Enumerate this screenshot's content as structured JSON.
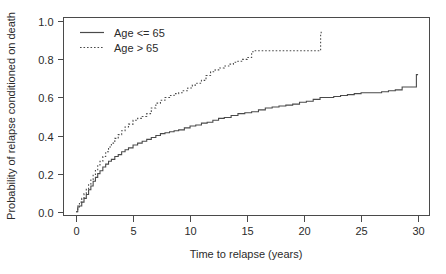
{
  "chart_data": {
    "type": "line",
    "title": "",
    "xlabel": "Time to relapse (years)",
    "ylabel": "Probability of relapse conditioned on death",
    "xlim": [
      -1.1,
      31.0
    ],
    "ylim": [
      -0.02,
      1.02
    ],
    "xticks": [
      0,
      5,
      10,
      15,
      20,
      25,
      30
    ],
    "xticklabels": [
      "0",
      "5",
      "10",
      "15",
      "20",
      "25",
      "30"
    ],
    "yticks": [
      0.0,
      0.2,
      0.4,
      0.6,
      0.8,
      1.0
    ],
    "yticklabels": [
      "0.0",
      "0.2",
      "0.4",
      "0.6",
      "0.8",
      "1.0"
    ],
    "grid": false,
    "frame": true,
    "legend_position": "top-left",
    "line_color": "#4a4a4a",
    "series": [
      {
        "name": "Age <= 65",
        "style": "solid",
        "step": true,
        "x": [
          0.0,
          0.15,
          0.3,
          0.5,
          0.7,
          0.9,
          1.1,
          1.3,
          1.5,
          1.7,
          1.9,
          2.1,
          2.35,
          2.6,
          2.85,
          3.1,
          3.4,
          3.7,
          4.0,
          4.3,
          4.6,
          5.0,
          5.4,
          5.8,
          6.2,
          6.6,
          7.0,
          7.4,
          7.8,
          8.2,
          8.6,
          9.0,
          9.5,
          10.0,
          10.5,
          11.0,
          11.5,
          12.0,
          12.5,
          13.0,
          13.6,
          14.2,
          14.8,
          15.4,
          16.0,
          16.6,
          17.2,
          17.8,
          18.4,
          19.0,
          19.6,
          20.2,
          20.8,
          21.4,
          22.0,
          22.6,
          23.2,
          23.8,
          24.4,
          25.0,
          25.6,
          26.2,
          26.8,
          27.4,
          28.0,
          28.6,
          29.2,
          29.6,
          29.85,
          30.0
        ],
        "y": [
          0.0,
          0.025,
          0.03,
          0.05,
          0.07,
          0.09,
          0.115,
          0.135,
          0.16,
          0.18,
          0.2,
          0.215,
          0.235,
          0.25,
          0.265,
          0.275,
          0.29,
          0.3,
          0.315,
          0.325,
          0.335,
          0.35,
          0.36,
          0.37,
          0.38,
          0.39,
          0.4,
          0.41,
          0.415,
          0.42,
          0.425,
          0.43,
          0.44,
          0.45,
          0.455,
          0.465,
          0.47,
          0.48,
          0.49,
          0.495,
          0.505,
          0.515,
          0.52,
          0.525,
          0.535,
          0.545,
          0.55,
          0.555,
          0.56,
          0.565,
          0.575,
          0.58,
          0.59,
          0.6,
          0.6,
          0.605,
          0.61,
          0.615,
          0.62,
          0.625,
          0.625,
          0.625,
          0.63,
          0.635,
          0.64,
          0.655,
          0.655,
          0.655,
          0.72,
          0.72
        ]
      },
      {
        "name": "Age > 65",
        "style": "dotted",
        "step": true,
        "x": [
          0.0,
          0.15,
          0.3,
          0.5,
          0.7,
          0.9,
          1.1,
          1.3,
          1.5,
          1.7,
          1.9,
          2.1,
          2.35,
          2.6,
          2.85,
          3.1,
          3.4,
          3.7,
          4.0,
          4.3,
          4.6,
          5.0,
          5.4,
          5.8,
          6.2,
          6.6,
          7.0,
          7.4,
          7.8,
          8.2,
          8.6,
          9.0,
          9.4,
          9.8,
          10.2,
          10.6,
          11.0,
          11.4,
          11.8,
          12.2,
          12.6,
          13.0,
          13.4,
          13.8,
          14.2,
          14.6,
          15.0,
          15.4,
          15.6,
          16.0,
          17.0,
          18.0,
          19.0,
          20.0,
          21.0,
          21.4,
          21.45,
          21.5
        ],
        "y": [
          0.0,
          0.03,
          0.05,
          0.07,
          0.095,
          0.12,
          0.145,
          0.17,
          0.195,
          0.22,
          0.245,
          0.265,
          0.29,
          0.315,
          0.34,
          0.36,
          0.385,
          0.405,
          0.425,
          0.445,
          0.46,
          0.48,
          0.49,
          0.5,
          0.515,
          0.545,
          0.57,
          0.585,
          0.6,
          0.61,
          0.62,
          0.625,
          0.635,
          0.65,
          0.665,
          0.675,
          0.69,
          0.715,
          0.735,
          0.745,
          0.755,
          0.765,
          0.775,
          0.785,
          0.79,
          0.8,
          0.81,
          0.84,
          0.845,
          0.845,
          0.845,
          0.845,
          0.845,
          0.845,
          0.845,
          0.845,
          0.93,
          0.95
        ]
      }
    ]
  },
  "legend": {
    "entries": [
      {
        "label": "Age <= 65",
        "style": "solid"
      },
      {
        "label": "Age > 65",
        "style": "dotted"
      }
    ]
  }
}
